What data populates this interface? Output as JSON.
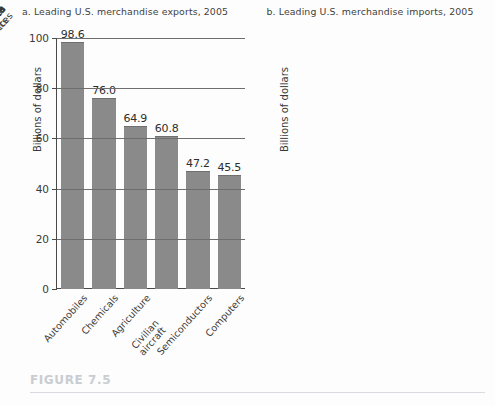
{
  "figure": {
    "caption_label": "FIGURE 7.5",
    "caption_color": "#c9cdd2",
    "rule_color": "#d8dbdf",
    "background": "#fdfdfd",
    "bar_color": "#8a8a8a",
    "axis_color": "#4a4a4a",
    "grid_color": "#6e6e6e"
  },
  "chart_data": [
    {
      "type": "bar",
      "panel_id": "a",
      "title": "a. Leading U.S. merchandise exports, 2005",
      "xlabel": "",
      "ylabel": "Billions of dollars",
      "ylim": [
        0,
        100
      ],
      "yticks": [
        0,
        20,
        40,
        60,
        80,
        100
      ],
      "ytick_labels": [
        "0",
        "20",
        "40",
        "60",
        "80",
        "100"
      ],
      "grid": true,
      "legend": "none",
      "categories": [
        "Automobiles",
        "Chemicals",
        "Agriculture",
        "Civilian aircraft",
        "Semiconductors",
        "Computers"
      ],
      "values": [
        98.6,
        76.0,
        64.9,
        60.8,
        47.2,
        45.5
      ],
      "value_labels": [
        "98.6",
        "76.0",
        "64.9",
        "60.8",
        "47.2",
        "45.5"
      ]
    },
    {
      "type": "bar",
      "panel_id": "b",
      "title": "b. Leading U.S. merchandise imports, 2005",
      "xlabel": "",
      "ylabel": "Billions of dollars",
      "ylim": [
        0,
        300
      ],
      "yticks": [
        0,
        50,
        100,
        150,
        200,
        250,
        300
      ],
      "ytick_labels": [
        "0",
        "50",
        "100",
        "150",
        "200",
        "250",
        "300"
      ],
      "grid": true,
      "legend": "none",
      "categories": [
        "Petroleum\nproducts",
        "Automobiles",
        "Household\nappliances",
        "Computers",
        "Textiles",
        "Agriculture"
      ],
      "values": [
        251.9,
        239.5,
        97.1,
        93.3,
        79.7,
        58.6
      ],
      "value_labels": [
        "251.9",
        "239.5",
        "97.1",
        "93.3",
        "79.7",
        "58.6"
      ]
    }
  ]
}
